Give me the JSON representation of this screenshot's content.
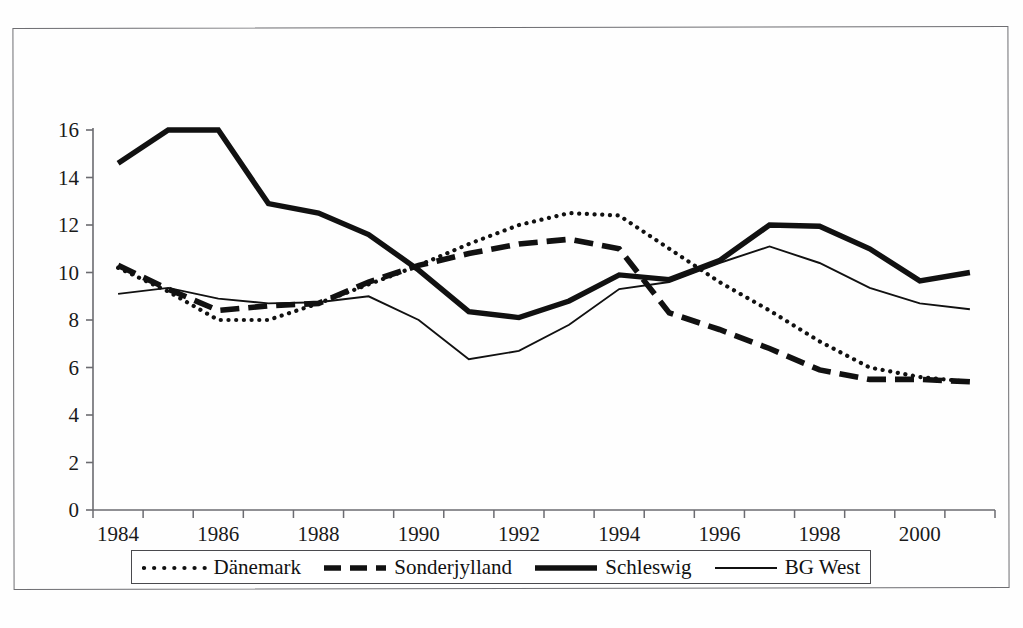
{
  "page": {
    "top_caption": "",
    "frame_border_color": "#6e6e72"
  },
  "legend": {
    "items": [
      {
        "label": "Dänemark",
        "style": "dotted",
        "color": "#111111"
      },
      {
        "label": "Sonderjylland",
        "style": "dashed",
        "color": "#111111"
      },
      {
        "label": "Schleswig",
        "style": "solid-thick",
        "color": "#111111"
      },
      {
        "label": "BG West",
        "style": "solid-thin",
        "color": "#111111"
      }
    ]
  },
  "chart_data": {
    "type": "line",
    "title": "",
    "xlabel": "",
    "ylabel": "",
    "xlim": [
      1984,
      2001
    ],
    "ylim": [
      0,
      16
    ],
    "ytick_step": 2,
    "grid": false,
    "legend_position": "bottom",
    "x": [
      1984,
      1985,
      1986,
      1987,
      1988,
      1989,
      1990,
      1991,
      1992,
      1993,
      1994,
      1995,
      1996,
      1997,
      1998,
      1999,
      2000,
      2001
    ],
    "xtick_labels": [
      "1984",
      "1986",
      "1988",
      "1990",
      "1992",
      "1994",
      "1996",
      "1998",
      "2000"
    ],
    "xtick_values": [
      1984,
      1986,
      1988,
      1990,
      1992,
      1994,
      1996,
      1998,
      2000
    ],
    "ytick_labels": [
      "0",
      "2",
      "4",
      "6",
      "8",
      "10",
      "12",
      "14",
      "16"
    ],
    "ytick_values": [
      0,
      2,
      4,
      6,
      8,
      10,
      12,
      14,
      16
    ],
    "series": [
      {
        "name": "Dänemark",
        "style": "dotted",
        "values": [
          10.2,
          9.2,
          8.0,
          8.0,
          8.7,
          9.5,
          10.3,
          11.2,
          12.0,
          12.5,
          12.4,
          11.0,
          9.6,
          8.4,
          7.1,
          6.0,
          5.6,
          5.4
        ]
      },
      {
        "name": "Sonderjylland",
        "style": "dashed",
        "values": [
          10.3,
          9.3,
          8.4,
          8.6,
          8.7,
          9.6,
          10.3,
          10.8,
          11.2,
          11.4,
          11.0,
          8.3,
          7.6,
          6.8,
          5.9,
          5.5,
          5.5,
          5.4
        ]
      },
      {
        "name": "Schleswig",
        "style": "solid-thick",
        "values": [
          14.6,
          16.0,
          16.0,
          12.9,
          12.5,
          11.6,
          10.1,
          8.35,
          8.1,
          8.8,
          9.9,
          9.7,
          10.5,
          12.0,
          11.95,
          11.0,
          9.65,
          10.0
        ]
      },
      {
        "name": "BG West",
        "style": "solid-thin",
        "values": [
          9.1,
          9.35,
          8.9,
          8.7,
          8.75,
          9.0,
          8.0,
          6.35,
          6.7,
          7.8,
          9.3,
          9.6,
          10.4,
          11.1,
          10.4,
          9.35,
          8.7,
          8.45
        ]
      }
    ]
  }
}
